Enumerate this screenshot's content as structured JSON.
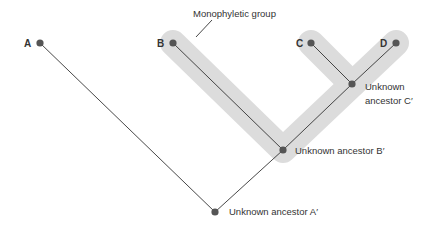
{
  "diagram": {
    "type": "phylogenetic-tree",
    "group_label": "Monophyletic group",
    "colors": {
      "background": "#ffffff",
      "highlight": "#dcdcdc",
      "node": "#555555",
      "line": "#333333",
      "text": "#333333"
    },
    "taxa": [
      {
        "id": "A",
        "label": "A"
      },
      {
        "id": "B",
        "label": "B"
      },
      {
        "id": "C",
        "label": "C"
      },
      {
        "id": "D",
        "label": "D"
      }
    ],
    "ancestors": [
      {
        "id": "Cp",
        "line1": "Unknown",
        "line2": "ancestor C′"
      },
      {
        "id": "Bp",
        "label": "Unknown ancestor B′"
      },
      {
        "id": "Ap",
        "label": "Unknown ancestor A′"
      }
    ],
    "edges": [
      [
        "A",
        "Ap"
      ],
      [
        "Ap",
        "Bp"
      ],
      [
        "B",
        "Bp"
      ],
      [
        "Bp",
        "Cp"
      ],
      [
        "C",
        "Cp"
      ],
      [
        "Cp",
        "D"
      ]
    ]
  }
}
